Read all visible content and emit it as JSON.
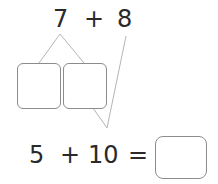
{
  "problem": {
    "top": {
      "a": "7",
      "op": "+",
      "b": "8"
    },
    "bottom": {
      "a": "5",
      "op": "+",
      "b": "10",
      "eq": "="
    }
  },
  "colors": {
    "text": "#2a2a2a",
    "line": "#b0b0b0",
    "box_border": "#8c8c8c"
  }
}
